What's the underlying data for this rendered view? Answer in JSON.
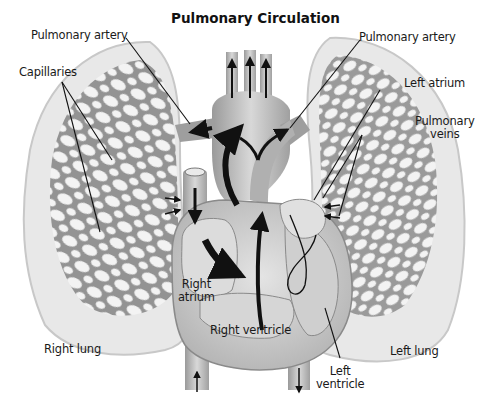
{
  "title": "Pulmonary Circulation",
  "labels": {
    "pulmonary_artery_left": "Pulmonary artery",
    "pulmonary_artery_right": "Pulmonary artery",
    "capillaries": "Capillaries",
    "left_atrium": "Left atrium",
    "pulmonary_veins_line1": "Pulmonary",
    "pulmonary_veins_line2": "veins",
    "right_atrium_line1": "Right",
    "right_atrium_line2": "atrium",
    "right_ventricle": "Right ventricle",
    "left_ventricle_line1": "Left",
    "left_ventricle_line2": "ventricle",
    "right_lung": "Right lung",
    "left_lung": "Left lung"
  },
  "colors": {
    "background": "#ffffff",
    "lung_fill": "#e6e6e6",
    "lung_edge": "#cfcfcf",
    "capillary_mesh": "#8f8f8f",
    "vessel_fill": "#b8b8b8",
    "heart_fill": "#d2d2d2",
    "arrow": "#111111",
    "leader_line": "#111111"
  }
}
